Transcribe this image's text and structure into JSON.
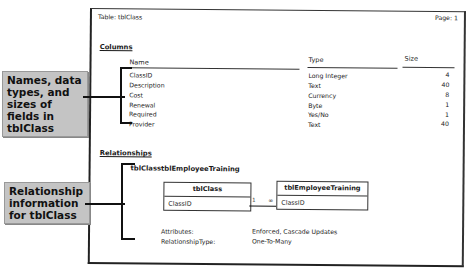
{
  "report": {
    "title": "Table: tblClass",
    "page_label": "Page: 1",
    "columns_section": {
      "heading": "Columns",
      "headers": {
        "name": "Name",
        "type": "Type",
        "size": "Size"
      },
      "rows": [
        {
          "name": "ClassID",
          "type": "Long Integer",
          "size": "4"
        },
        {
          "name": "Description",
          "type": "Text",
          "size": "40"
        },
        {
          "name": "Cost",
          "type": "Currency",
          "size": "8"
        },
        {
          "name": "Renewal",
          "type": "Byte",
          "size": "1"
        },
        {
          "name": "Required",
          "type": "Yes/No",
          "size": "1"
        },
        {
          "name": "Provider",
          "type": "Text",
          "size": "40"
        }
      ]
    },
    "relationships_section": {
      "heading": "Relationships",
      "relationship_name": "tblClasstblEmployeeTraining",
      "left_table": {
        "name": "tblClass",
        "field": "ClassID"
      },
      "right_table": {
        "name": "tblEmployeeTraining",
        "field": "ClassID"
      },
      "cardinality_left": "1",
      "cardinality_right": "∞",
      "attributes_label": "Attributes:",
      "attributes_value": "Enforced, Cascade Updates",
      "relationship_type_label": "RelationshipType:",
      "relationship_type_value": "One-To-Many"
    }
  },
  "callouts": {
    "fields": "Names, data types, and sizes of fields in tblClass",
    "relationship": "Relationship information for tblClass"
  }
}
